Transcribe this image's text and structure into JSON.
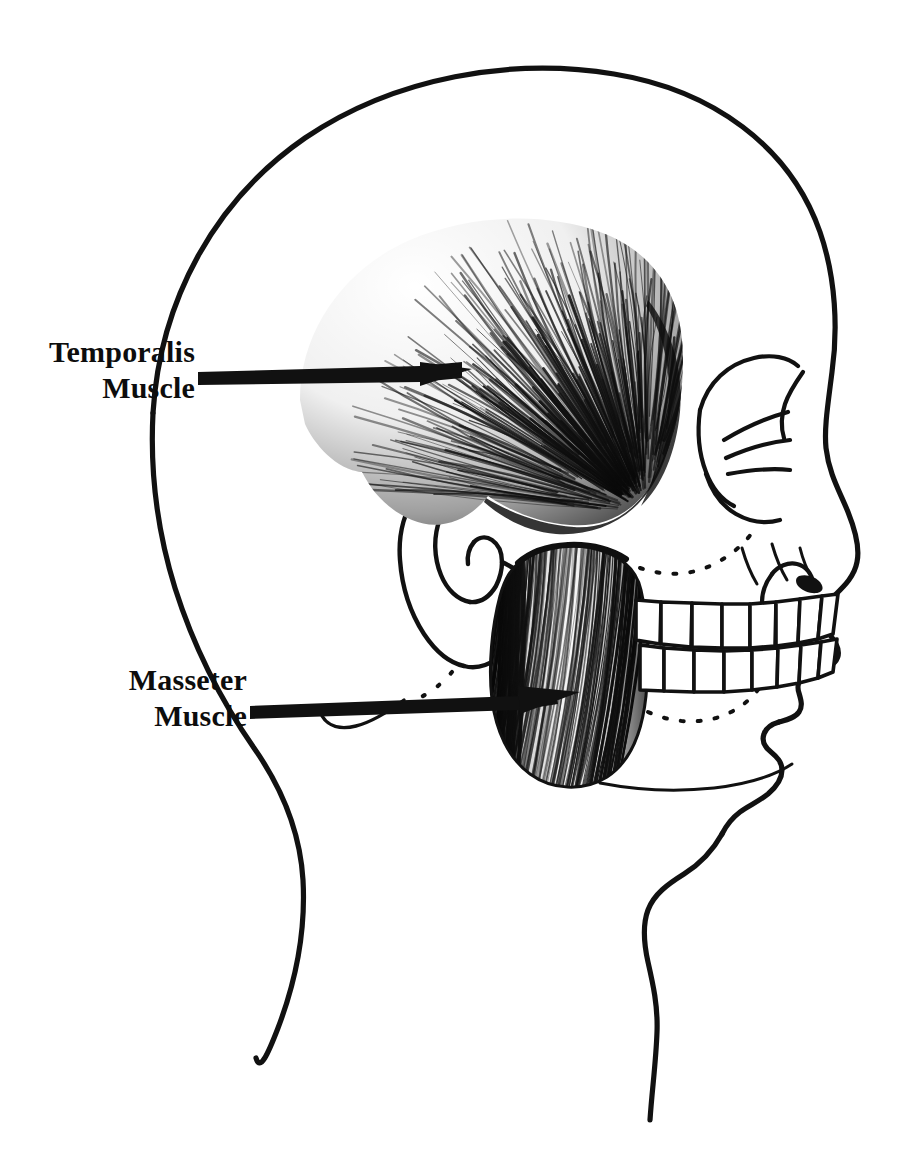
{
  "figure": {
    "view": "left lateral profile, facing right",
    "background_color": "#ffffff",
    "ink_color": "#111111",
    "line_art_stroke": "#111111"
  },
  "labels": [
    {
      "id": "temporalis",
      "line1": "Temporalis",
      "line2": "Muscle",
      "text_anchor_x": 195,
      "text_line1_y": 362,
      "text_line2_y": 398,
      "leader": {
        "type": "bar-with-arrowhead",
        "from_x": 198,
        "from_y": 379,
        "to_x": 460,
        "to_y": 370,
        "thickness": 13,
        "color": "#111111"
      },
      "points_to": "temporalis-muscle-fan"
    },
    {
      "id": "masseter",
      "line1": "Masseter",
      "line2": "Muscle",
      "text_anchor_x": 247,
      "text_line1_y": 690,
      "text_line2_y": 726,
      "leader": {
        "type": "bar-with-arrowhead",
        "from_x": 250,
        "from_y": 711,
        "to_x": 572,
        "to_y": 693,
        "thickness": 13,
        "color": "#111111"
      },
      "points_to": "masseter-muscle-body"
    }
  ],
  "anatomy": {
    "structures": [
      {
        "name": "head-outline",
        "kind": "contour",
        "description": "cranium, forehead, nose, lips, chin and neck profile"
      },
      {
        "name": "temporalis-muscle-fan",
        "kind": "muscle",
        "description": "fan shaped muscle over temporal region with radiating fibers converging to coronoid process"
      },
      {
        "name": "masseter-muscle-body",
        "kind": "muscle",
        "description": "quadrangular muscle over the ramus of the mandible with diagonal striations"
      },
      {
        "name": "ear-pinna",
        "kind": "contour",
        "description": "external ear with helix, antihelix, tragus and lobe"
      },
      {
        "name": "orbit-eye-socket",
        "kind": "contour",
        "description": "bony orbit and brow ridge"
      },
      {
        "name": "nose-profile",
        "kind": "contour",
        "description": "nasal bridge, tip and nostril"
      },
      {
        "name": "upper-teeth-row",
        "kind": "teeth",
        "count": 8
      },
      {
        "name": "lower-teeth-row",
        "kind": "teeth",
        "count": 8
      },
      {
        "name": "zygomatic-dotted-line",
        "kind": "dotted-guide",
        "description": "dotted line tracing the zygomatic arch / maxilla"
      },
      {
        "name": "mandible-dotted-line",
        "kind": "dotted-guide",
        "description": "dotted line tracing the mandible body"
      },
      {
        "name": "mastoid-dotted-line",
        "kind": "dotted-guide",
        "description": "dotted line below the ear"
      },
      {
        "name": "jaw-line",
        "kind": "contour",
        "description": "inferior border of mandible"
      },
      {
        "name": "neck-back-contour",
        "kind": "contour"
      },
      {
        "name": "neck-front-contour",
        "kind": "contour"
      }
    ]
  }
}
